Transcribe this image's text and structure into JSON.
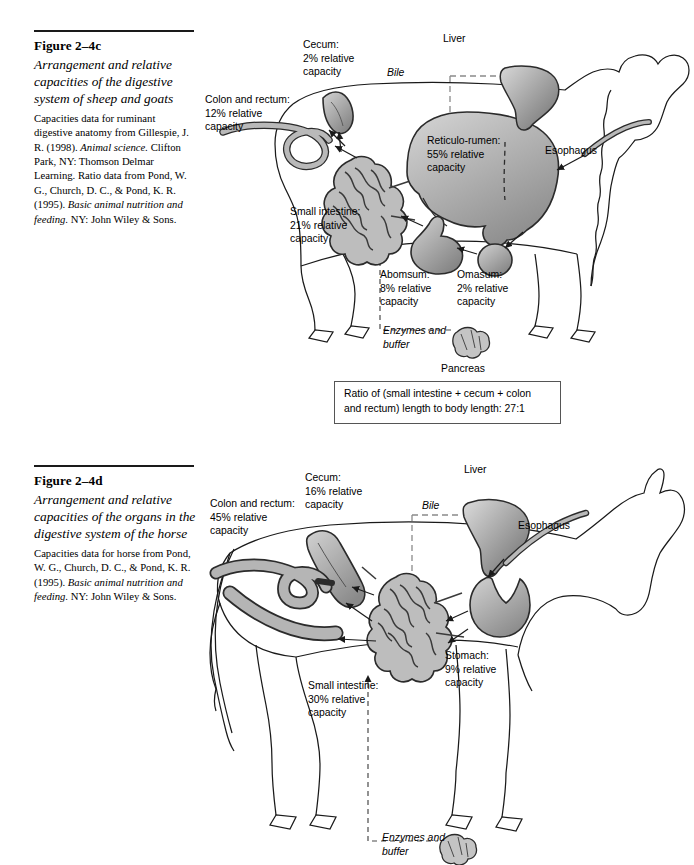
{
  "page": {
    "background": "#ffffff",
    "width": 694,
    "height": 865
  },
  "figures": [
    {
      "id": "figure-2-4c",
      "number": "Figure 2–4c",
      "title": "Arrangement and relative capacities of the digestive system of sheep and goats",
      "source_plain_1": "Capacities data for ruminant digestive anatomy from Gillespie, J. R. (1998). ",
      "source_italic_1": "Animal science.",
      "source_plain_2": " Clifton Park, NY: Thomson Delmar Learning. Ratio data from Pond, W. G., Church, D. C., & Pond, K. R. (1995). ",
      "source_italic_2": "Basic animal nutrition and feeding.",
      "source_plain_3": " NY: John Wiley & Sons.",
      "animal": "sheep",
      "labels": [
        {
          "name": "cecum",
          "text": "Cecum:\n2% relative\ncapacity",
          "organ": "Cecum",
          "value": 2,
          "unit": "% relative capacity"
        },
        {
          "name": "colon-and-rectum",
          "text": "Colon and rectum:\n12% relative\ncapacity",
          "organ": "Colon and rectum",
          "value": 12,
          "unit": "% relative capacity"
        },
        {
          "name": "liver",
          "text": "Liver",
          "organ": "Liver"
        },
        {
          "name": "bile",
          "text": "Bile",
          "italic": true
        },
        {
          "name": "reticulo-rumen",
          "text": "Reticulo-rumen:\n55% relative\ncapacity",
          "organ": "Reticulo-rumen",
          "value": 55,
          "unit": "% relative capacity"
        },
        {
          "name": "esophagus",
          "text": "Esophagus",
          "organ": "Esophagus"
        },
        {
          "name": "small-intestine",
          "text": "Small intestine:\n21% relative\ncapacity",
          "organ": "Small intestine",
          "value": 21,
          "unit": "% relative capacity"
        },
        {
          "name": "abomasum",
          "text": "Abomsum:\n8% relative\ncapacity",
          "organ": "Abomsum",
          "value": 8,
          "unit": "% relative capacity"
        },
        {
          "name": "omasum",
          "text": "Omasum:\n2% relative\ncapacity",
          "organ": "Omasum",
          "value": 2,
          "unit": "% relative capacity"
        },
        {
          "name": "enzymes-and-buffer",
          "text": "Enzymes and\nbuffer",
          "italic": true
        },
        {
          "name": "pancreas",
          "text": "Pancreas",
          "organ": "Pancreas"
        }
      ],
      "ratio_note": "Ratio of (small intestine + cecum + colon\nand rectum) length to body length: 27:1",
      "ratio_value": "27:1"
    },
    {
      "id": "figure-2-4d",
      "number": "Figure 2–4d",
      "title": "Arrangement and relative capacities of the organs in the digestive system of the horse",
      "source_plain_1": "Capacities data for horse from Pond, W. G., Church, D. C., & Pond, K. R. (1995). ",
      "source_italic_1": "Basic animal nutrition and feeding.",
      "source_plain_2": " NY: John Wiley & Sons.",
      "animal": "horse",
      "labels": [
        {
          "name": "cecum",
          "text": "Cecum:\n16% relative\ncapacity",
          "organ": "Cecum",
          "value": 16,
          "unit": "% relative capacity"
        },
        {
          "name": "colon-and-rectum",
          "text": "Colon and rectum:\n45% relative\ncapacity",
          "organ": "Colon and rectum",
          "value": 45,
          "unit": "% relative capacity"
        },
        {
          "name": "liver",
          "text": "Liver",
          "organ": "Liver"
        },
        {
          "name": "bile",
          "text": "Bile",
          "italic": true
        },
        {
          "name": "esophagus",
          "text": "Esophagus",
          "organ": "Esophagus"
        },
        {
          "name": "stomach",
          "text": "Stomach:\n9% relative\ncapacity",
          "organ": "Stomach",
          "value": 9,
          "unit": "% relative capacity"
        },
        {
          "name": "small-intestine",
          "text": "Small intestine:\n30% relative\ncapacity",
          "organ": "Small intestine",
          "value": 30,
          "unit": "% relative capacity"
        },
        {
          "name": "enzymes-and-buffer",
          "text": "Enzymes and\nbuffer",
          "italic": true
        }
      ]
    }
  ],
  "colors": {
    "organ_fill_light": "#c9c9c9",
    "organ_fill_dark": "#8d8d8d",
    "outline": "#2b2b2b",
    "body_outline": "#1a1a1a",
    "dashed_flow": "#808080",
    "rule": "#1a1a1a"
  }
}
